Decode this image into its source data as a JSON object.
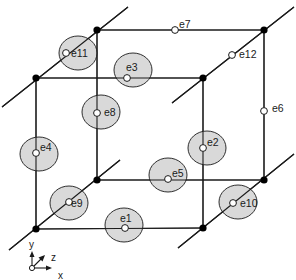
{
  "diagram": {
    "type": "hexahedral edge element with 12 edge unknowns",
    "nodes": [
      {
        "id": "n-back-top-left",
        "x": 97,
        "y": 30
      },
      {
        "id": "n-back-top-right",
        "x": 264,
        "y": 30
      },
      {
        "id": "n-front-top-left",
        "x": 36,
        "y": 78
      },
      {
        "id": "n-front-top-right",
        "x": 203,
        "y": 78
      },
      {
        "id": "n-back-bottom-left",
        "x": 97,
        "y": 180
      },
      {
        "id": "n-back-bottom-right",
        "x": 264,
        "y": 180
      },
      {
        "id": "n-front-bottom-left",
        "x": 36,
        "y": 229
      },
      {
        "id": "n-front-bottom-right",
        "x": 203,
        "y": 228
      }
    ],
    "edges": [
      {
        "label": "e1",
        "px": 125,
        "py": 228,
        "shaded": true,
        "cx": 124,
        "cy": 225,
        "lx": 120,
        "ly": 222
      },
      {
        "label": "e2",
        "px": 203,
        "py": 147,
        "shaded": true,
        "cx": 206,
        "cy": 148,
        "lx": 207,
        "ly": 146
      },
      {
        "label": "e3",
        "px": 127,
        "py": 78,
        "shaded": true,
        "cx": 133,
        "cy": 70,
        "lx": 126,
        "ly": 71
      },
      {
        "label": "e4",
        "px": 36,
        "py": 153,
        "shaded": true,
        "cx": 39,
        "cy": 154,
        "lx": 40,
        "ly": 151
      },
      {
        "label": "e5",
        "px": 168,
        "py": 179,
        "shaded": true,
        "cx": 168,
        "cy": 175,
        "lx": 172,
        "ly": 177
      },
      {
        "label": "e6",
        "px": 264,
        "py": 111,
        "shaded": false,
        "lx": 272,
        "ly": 111
      },
      {
        "label": "e7",
        "px": 175,
        "py": 30,
        "shaded": false,
        "lx": 179,
        "ly": 27
      },
      {
        "label": "e8",
        "px": 97,
        "py": 113,
        "shaded": true,
        "cx": 101,
        "cy": 112,
        "lx": 104,
        "ly": 115
      },
      {
        "label": "e9",
        "px": 69,
        "py": 202,
        "shaded": true,
        "cx": 68,
        "cy": 203,
        "lx": 71,
        "ly": 206
      },
      {
        "label": "e10",
        "px": 233,
        "py": 203,
        "shaded": true,
        "cx": 238,
        "cy": 202,
        "lx": 240,
        "ly": 207
      },
      {
        "label": "e11",
        "px": 66,
        "py": 53,
        "shaded": true,
        "cx": 78,
        "cy": 53,
        "lx": 72,
        "ly": 57
      },
      {
        "label": "e12",
        "px": 232,
        "py": 55,
        "shaded": false,
        "lx": 239,
        "ly": 58
      }
    ],
    "axes": {
      "origin": {
        "x": 32,
        "y": 268
      },
      "labels": {
        "x": "x",
        "y": "y",
        "z": "z"
      }
    },
    "colors": {
      "line": "#1a1a1a",
      "node": "#000000",
      "disk_fill": "#d9d9d9",
      "dof_fill": "#ffffff"
    }
  }
}
